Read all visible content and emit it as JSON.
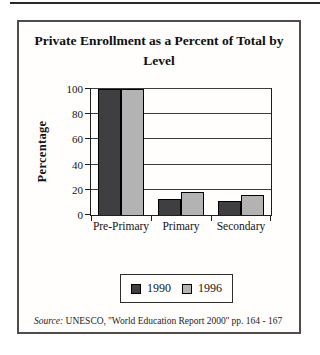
{
  "page": {
    "source_label": "Source:",
    "source_text": " UNESCO, ''World Education Report 2000'' pp. 164 - 167"
  },
  "chart_data": {
    "type": "bar",
    "title": "Private Enrollment as a Percent of Total by Level",
    "categories": [
      "Pre-Primary",
      "Primary",
      "Secondary"
    ],
    "series": [
      {
        "name": "1990",
        "color": "#3f3f41",
        "values": [
          100,
          13,
          11
        ]
      },
      {
        "name": "1996",
        "color": "#b3b3b3",
        "values": [
          100,
          18,
          16
        ]
      }
    ],
    "xlabel": "",
    "ylabel": "Percentage",
    "ylim": [
      0,
      100
    ],
    "ytick_step": 20,
    "grid": true,
    "legend_position": "bottom"
  }
}
